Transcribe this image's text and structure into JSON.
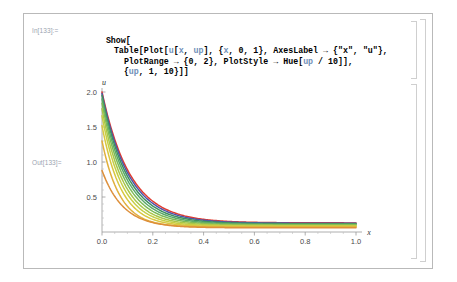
{
  "notebook": {
    "input_cell": {
      "label": "In[133]:=",
      "lines": [
        "Show[",
        "Table[Plot[u[x, up], {x, 0, 1}, AxesLabel → {\"x\", \"u\"},",
        "PlotRange → {0, 2}, PlotStyle → Hue[up / 10]],",
        "{up, 1, 10}]]"
      ]
    },
    "output_cell": {
      "label": "Out[133]="
    },
    "brackets": {
      "outer": "outer-cell-bracket",
      "input": "input-cell-bracket",
      "output": "output-cell-bracket"
    }
  },
  "chart_data": {
    "type": "line",
    "title": "",
    "xlabel": "x",
    "ylabel": "u",
    "xlim": [
      0,
      1
    ],
    "ylim": [
      0,
      2
    ],
    "xticks": [
      "0.0",
      "0.2",
      "0.4",
      "0.6",
      "0.8",
      "1.0"
    ],
    "xtick_values": [
      0.0,
      0.2,
      0.4,
      0.6,
      0.8,
      1.0
    ],
    "yticks": [
      "0.5",
      "1.0",
      "1.5",
      "2.0"
    ],
    "ytick_values": [
      0.5,
      1.0,
      1.5,
      2.0
    ],
    "grid": false,
    "legend": "none",
    "colors": [
      "#e03a2f",
      "#4f55a8",
      "#3f8f5f",
      "#5aa86a",
      "#7cba58",
      "#a8c64a",
      "#c6cf45",
      "#d8c840",
      "#e0b03c",
      "#dd8f3a"
    ],
    "series": [
      {
        "name": "up = 1",
        "color": "#e03a2f",
        "start_y": 2.0,
        "decay": 9.0,
        "tail": 0.13
      },
      {
        "name": "up = 2",
        "color": "#4f55a8",
        "start_y": 1.98,
        "decay": 9.4,
        "tail": 0.125
      },
      {
        "name": "up = 3",
        "color": "#3f8f5f",
        "start_y": 1.95,
        "decay": 9.9,
        "tail": 0.118
      },
      {
        "name": "up = 4",
        "color": "#5aa86a",
        "start_y": 1.9,
        "decay": 10.4,
        "tail": 0.11
      },
      {
        "name": "up = 5",
        "color": "#7cba58",
        "start_y": 1.84,
        "decay": 11.0,
        "tail": 0.102
      },
      {
        "name": "up = 6",
        "color": "#a8c64a",
        "start_y": 1.76,
        "decay": 11.7,
        "tail": 0.094
      },
      {
        "name": "up = 7",
        "color": "#c6cf45",
        "start_y": 1.66,
        "decay": 12.4,
        "tail": 0.086
      },
      {
        "name": "up = 8",
        "color": "#d8c840",
        "start_y": 1.52,
        "decay": 13.2,
        "tail": 0.078
      },
      {
        "name": "up = 9",
        "color": "#e0b03c",
        "start_y": 1.3,
        "decay": 14.2,
        "tail": 0.07
      },
      {
        "name": "up = 10",
        "color": "#dd8f3a",
        "start_y": 0.88,
        "decay": 12.0,
        "tail": 0.06
      }
    ]
  }
}
